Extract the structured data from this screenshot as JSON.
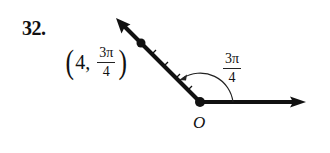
{
  "problem": {
    "number": "32."
  },
  "diagram": {
    "type": "polar-coordinate-point",
    "origin_label": "O",
    "point": {
      "r": "4",
      "theta_numerator": "3π",
      "theta_denominator": "4",
      "open_paren": "(",
      "close_paren": ")",
      "comma": ","
    },
    "angle": {
      "numerator": "3π",
      "denominator": "4"
    },
    "tick_count": 4,
    "colors": {
      "stroke": "#111111",
      "background": "#ffffff"
    }
  }
}
